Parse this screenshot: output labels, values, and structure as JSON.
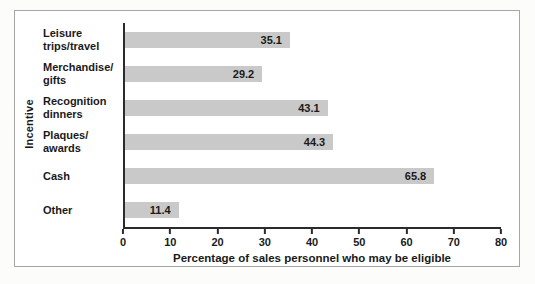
{
  "chart_data": {
    "type": "bar",
    "orientation": "horizontal",
    "title": "",
    "categories": [
      "Leisure trips/travel",
      "Merchandise/gifts",
      "Recognition dinners",
      "Plaques/awards",
      "Cash",
      "Other"
    ],
    "display_categories": [
      "Leisure\ntrips/travel",
      "Merchandise/\ngifts",
      "Recognition\ndinners",
      "Plaques/\nawards",
      "Cash",
      "Other"
    ],
    "values": [
      35.1,
      29.2,
      43.1,
      44.3,
      65.8,
      11.4
    ],
    "value_labels": [
      "35.1",
      "29.2",
      "43.1",
      "44.3",
      "65.8",
      "11.4"
    ],
    "xlabel": "Percentage of sales personnel who may be eligible",
    "ylabel": "Incentive",
    "xlim": [
      0,
      80
    ],
    "xticks": [
      0,
      10,
      20,
      30,
      40,
      50,
      60,
      70,
      80
    ],
    "bar_color": "#c9c9c9",
    "axis_color": "#2b2b2b",
    "frame_border_color": "#a6a6a6",
    "grid": false,
    "legend": "none"
  }
}
